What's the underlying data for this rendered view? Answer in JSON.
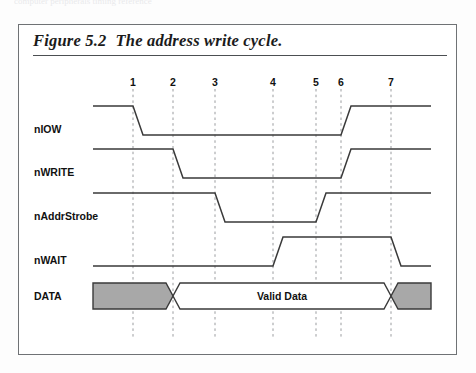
{
  "scan_artifact_text": "computer peripherals timing reference",
  "figure": {
    "number": "Figure 5.2",
    "title": "The address write cycle."
  },
  "tick_numbers": [
    "1",
    "2",
    "3",
    "4",
    "5",
    "6",
    "7"
  ],
  "signals": [
    {
      "name": "nIOW",
      "label": "nIOW"
    },
    {
      "name": "nWRITE",
      "label": "nWRITE"
    },
    {
      "name": "nAddrStrobe",
      "label": "nAddrStrobe"
    },
    {
      "name": "nWAIT",
      "label": "nWAIT"
    },
    {
      "name": "DATA",
      "label": "DATA"
    }
  ],
  "bus_label": "Valid Data",
  "colors": {
    "line": "#3a3a3a",
    "grid": "#999b9e",
    "invalid_fill": "#a8a8a8",
    "frame": "#6f7275",
    "text": "#111111"
  },
  "chart_data": {
    "type": "line",
    "title": "The address write cycle.",
    "xlabel": "",
    "ylabel": "",
    "grid": true,
    "legend_position": "left-labels",
    "x_ticks": [
      1,
      2,
      3,
      4,
      5,
      6,
      7
    ],
    "x_tick_px": [
      132,
      172,
      214,
      272,
      315,
      340,
      390
    ],
    "x_range_px": [
      92,
      430
    ],
    "series": [
      {
        "name": "nIOW",
        "type": "digital",
        "row_px": {
          "high": 105,
          "low": 134
        },
        "transitions": [
          {
            "tick": 1,
            "from": "high",
            "to": "low"
          },
          {
            "tick": 6,
            "from": "low",
            "to": "high"
          }
        ],
        "levels": "high until 1, low 1-6, high after 6"
      },
      {
        "name": "nWRITE",
        "type": "digital",
        "row_px": {
          "high": 148,
          "low": 177
        },
        "transitions": [
          {
            "tick": 2,
            "from": "high",
            "to": "low"
          },
          {
            "tick": 6,
            "from": "low",
            "to": "high"
          }
        ],
        "levels": "high until 2, low 2-6, high after 6"
      },
      {
        "name": "nAddrStrobe",
        "type": "digital",
        "row_px": {
          "high": 192,
          "low": 221
        },
        "transitions": [
          {
            "tick": 3,
            "from": "high",
            "to": "low"
          },
          {
            "tick": 5,
            "from": "low",
            "to": "high"
          }
        ],
        "levels": "high until 3, low 3-5, high after 5"
      },
      {
        "name": "nWAIT",
        "type": "digital",
        "row_px": {
          "high": 236,
          "low": 265
        },
        "transitions": [
          {
            "tick": 4,
            "from": "low",
            "to": "high"
          },
          {
            "tick": 7,
            "from": "high",
            "to": "low"
          }
        ],
        "levels": "low until 4, high 4-7, low after 7"
      },
      {
        "name": "DATA",
        "type": "bus",
        "row_px": {
          "top": 282,
          "bottom": 308
        },
        "segments": [
          {
            "from_px": 92,
            "to_px": 172,
            "state": "invalid",
            "label": ""
          },
          {
            "from_px": 172,
            "to_px": 390,
            "state": "valid",
            "label": "Valid Data"
          },
          {
            "from_px": 390,
            "to_px": 430,
            "state": "invalid",
            "label": ""
          }
        ],
        "crossovers_at_ticks": [
          2,
          7
        ]
      }
    ]
  }
}
